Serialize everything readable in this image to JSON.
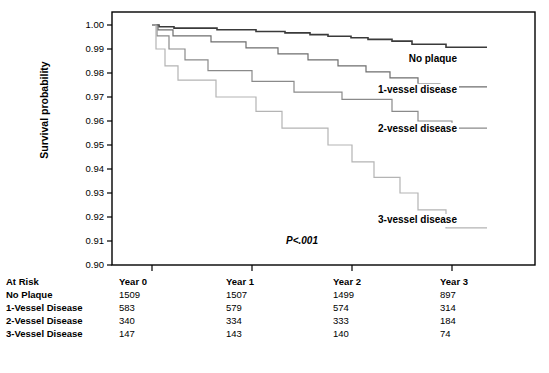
{
  "chart_data": {
    "type": "line",
    "title": "",
    "xlabel": "",
    "ylabel": "Survival probability",
    "ylim": [
      0.9,
      1.0
    ],
    "xlim": [
      0,
      3.35
    ],
    "grid": false,
    "legend_position": "inline-right",
    "annotation": "P<.001",
    "y_ticks": [
      "1.00",
      "0.99",
      "0.98",
      "0.97",
      "0.96",
      "0.95",
      "0.94",
      "0.93",
      "0.92",
      "0.91",
      "0.90"
    ],
    "y_tick_values": [
      1.0,
      0.99,
      0.98,
      0.97,
      0.96,
      0.95,
      0.94,
      0.93,
      0.92,
      0.91,
      0.9
    ],
    "x_ticks": [
      "Year 0",
      "Year 1",
      "Year 2",
      "Year 3"
    ],
    "x_tick_values": [
      0,
      1,
      2,
      3
    ],
    "series": [
      {
        "name": "No plaque",
        "color": "#3a3a3a",
        "width": 1.6,
        "label_x": 3.05,
        "label_y": 0.9845,
        "points": [
          [
            0.0,
            1.0
          ],
          [
            0.07,
            0.9993
          ],
          [
            0.2,
            0.9993
          ],
          [
            0.22,
            0.9987
          ],
          [
            0.62,
            0.9987
          ],
          [
            0.65,
            0.998
          ],
          [
            1.0,
            0.998
          ],
          [
            1.04,
            0.9973
          ],
          [
            1.3,
            0.9973
          ],
          [
            1.33,
            0.9967
          ],
          [
            1.55,
            0.9967
          ],
          [
            1.58,
            0.996
          ],
          [
            1.72,
            0.996
          ],
          [
            1.76,
            0.9953
          ],
          [
            1.95,
            0.9953
          ],
          [
            1.99,
            0.9947
          ],
          [
            2.12,
            0.9947
          ],
          [
            2.16,
            0.994
          ],
          [
            2.36,
            0.994
          ],
          [
            2.4,
            0.9933
          ],
          [
            2.56,
            0.9933
          ],
          [
            2.6,
            0.992
          ],
          [
            2.9,
            0.992
          ],
          [
            2.94,
            0.9907
          ],
          [
            3.35,
            0.9907
          ]
        ]
      },
      {
        "name": "1-vessel disease",
        "color": "#6e6e6e",
        "width": 1.2,
        "label_x": 3.05,
        "label_y": 0.9718,
        "points": [
          [
            0.0,
            1.0
          ],
          [
            0.06,
            0.998
          ],
          [
            0.18,
            0.998
          ],
          [
            0.21,
            0.9955
          ],
          [
            0.55,
            0.9955
          ],
          [
            0.59,
            0.993
          ],
          [
            0.9,
            0.993
          ],
          [
            0.94,
            0.9905
          ],
          [
            1.22,
            0.9905
          ],
          [
            1.26,
            0.988
          ],
          [
            1.52,
            0.988
          ],
          [
            1.56,
            0.9855
          ],
          [
            1.82,
            0.9855
          ],
          [
            1.86,
            0.983
          ],
          [
            2.1,
            0.983
          ],
          [
            2.14,
            0.9805
          ],
          [
            2.34,
            0.9805
          ],
          [
            2.38,
            0.978
          ],
          [
            2.62,
            0.978
          ],
          [
            2.66,
            0.9755
          ],
          [
            2.84,
            0.9755
          ],
          [
            2.88,
            0.9742
          ],
          [
            3.35,
            0.9742
          ]
        ]
      },
      {
        "name": "2-vessel disease",
        "color": "#8a8a8a",
        "width": 1.2,
        "label_x": 3.05,
        "label_y": 0.9555,
        "points": [
          [
            0.0,
            1.0
          ],
          [
            0.05,
            0.9955
          ],
          [
            0.14,
            0.9955
          ],
          [
            0.17,
            0.99
          ],
          [
            0.3,
            0.99
          ],
          [
            0.33,
            0.9855
          ],
          [
            0.52,
            0.9855
          ],
          [
            0.56,
            0.981
          ],
          [
            0.96,
            0.981
          ],
          [
            1.0,
            0.9765
          ],
          [
            1.38,
            0.9765
          ],
          [
            1.42,
            0.972
          ],
          [
            1.86,
            0.972
          ],
          [
            1.9,
            0.969
          ],
          [
            2.36,
            0.969
          ],
          [
            2.4,
            0.964
          ],
          [
            2.62,
            0.964
          ],
          [
            2.66,
            0.96
          ],
          [
            2.96,
            0.96
          ],
          [
            3.0,
            0.957
          ],
          [
            3.35,
            0.957
          ]
        ]
      },
      {
        "name": "3-vessel disease",
        "color": "#b4b4b4",
        "width": 1.2,
        "label_x": 3.05,
        "label_y": 0.9175,
        "points": [
          [
            0.0,
            1.0
          ],
          [
            0.04,
            0.99
          ],
          [
            0.1,
            0.99
          ],
          [
            0.13,
            0.983
          ],
          [
            0.22,
            0.983
          ],
          [
            0.26,
            0.977
          ],
          [
            0.6,
            0.977
          ],
          [
            0.64,
            0.97
          ],
          [
            1.0,
            0.97
          ],
          [
            1.04,
            0.964
          ],
          [
            1.26,
            0.964
          ],
          [
            1.3,
            0.957
          ],
          [
            1.72,
            0.957
          ],
          [
            1.76,
            0.95
          ],
          [
            1.96,
            0.95
          ],
          [
            2.0,
            0.943
          ],
          [
            2.18,
            0.943
          ],
          [
            2.22,
            0.9365
          ],
          [
            2.44,
            0.9365
          ],
          [
            2.48,
            0.93
          ],
          [
            2.62,
            0.93
          ],
          [
            2.66,
            0.923
          ],
          [
            2.9,
            0.923
          ],
          [
            2.94,
            0.9155
          ],
          [
            3.35,
            0.9155
          ]
        ]
      }
    ]
  },
  "risk_table": {
    "columns": [
      "At Risk",
      "Year 0",
      "Year 1",
      "Year 2",
      "Year 3"
    ],
    "rows": [
      {
        "label": "No Plaque",
        "values": [
          "1509",
          "1507",
          "1499",
          "897"
        ]
      },
      {
        "label": "1-Vessel Disease",
        "values": [
          "583",
          "579",
          "574",
          "314"
        ]
      },
      {
        "label": "2-Vessel Disease",
        "values": [
          "340",
          "334",
          "333",
          "184"
        ]
      },
      {
        "label": "3-Vessel Disease",
        "values": [
          "147",
          "143",
          "140",
          "74"
        ]
      }
    ]
  }
}
